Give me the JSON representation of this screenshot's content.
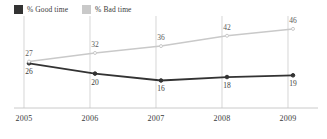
{
  "legend": {
    "position": "top-left",
    "entries": [
      {
        "label": "% Good time",
        "color": "#333333",
        "swatch": "legend-swatch-good"
      },
      {
        "label": "% Bad time",
        "color": "#c9c9c9",
        "swatch": "legend-swatch-bad"
      }
    ]
  },
  "chart_data": {
    "type": "line",
    "title": "",
    "subtitle": "",
    "xlabel": "",
    "ylabel": "",
    "categories": [
      "2005",
      "2006",
      "2007",
      "2008",
      "2009"
    ],
    "x": [
      2005,
      2006,
      2007,
      2008,
      2009
    ],
    "series": [
      {
        "name": "% Good time",
        "color": "#333333",
        "values": [
          26,
          20,
          16,
          18,
          19
        ],
        "labels": [
          "26",
          "20",
          "16",
          "18",
          "19"
        ],
        "label_position": "below"
      },
      {
        "name": "% Bad time",
        "color": "#c9c9c9",
        "values": [
          27,
          32,
          36,
          42,
          46
        ],
        "labels": [
          "27",
          "32",
          "36",
          "42",
          "46"
        ],
        "label_position": "above"
      }
    ],
    "ylim": [
      0,
      50
    ],
    "xlim": [
      2005,
      2009
    ],
    "grid": {
      "vertical": true,
      "horizontal": false,
      "baseline": true
    },
    "legend_position": "top-left",
    "markers": true,
    "axis_color": "#c4c4c4"
  },
  "axis": {
    "ticks": [
      "2005",
      "2006",
      "2007",
      "2008",
      "2009"
    ]
  }
}
